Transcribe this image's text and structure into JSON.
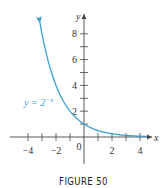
{
  "chart_data": {
    "type": "line",
    "title": "",
    "xlabel": "x",
    "ylabel": "y",
    "xlim": [
      -4.3,
      4.7
    ],
    "ylim": [
      -2,
      9.5
    ],
    "grid": false,
    "legend": null,
    "x_ticks": [
      -4,
      -3,
      -2,
      -1,
      0,
      1,
      2,
      3,
      4
    ],
    "x_tick_labels": [
      "-4",
      "-2",
      "0",
      "2",
      "4"
    ],
    "y_ticks": [
      1,
      2,
      3,
      4,
      5,
      6,
      7,
      8
    ],
    "y_tick_labels": [
      "2",
      "4",
      "6",
      "8"
    ],
    "series": [
      {
        "name": "y = 2^-x",
        "function": "2^(-x)",
        "x": [
          -3.15,
          -3,
          -2.5,
          -2,
          -1.5,
          -1,
          -0.5,
          0,
          0.5,
          1,
          1.5,
          2,
          2.5,
          3,
          3.5,
          4,
          4.5
        ],
        "values": [
          8.88,
          8,
          5.66,
          4,
          2.83,
          2,
          1.41,
          1,
          0.71,
          0.5,
          0.35,
          0.25,
          0.18,
          0.125,
          0.09,
          0.0625,
          0.044
        ],
        "color": "#3a9fd0"
      }
    ],
    "annotations": [
      {
        "text": "y = 2",
        "superscript": "−x",
        "position": "left of curve near y≈2.7"
      }
    ]
  },
  "labels": {
    "y_axis": "y",
    "x_axis": "x",
    "origin": "0",
    "curve_label_base": "y = 2",
    "curve_label_exp": "−x",
    "x_tick_text": [
      "−4",
      "−2",
      "2",
      "4"
    ],
    "y_tick_text": [
      "2",
      "4",
      "6",
      "8"
    ]
  },
  "caption": "FIGURE 50",
  "colors": {
    "curve": "#3a9fd0",
    "axis": "#444444",
    "text": "#333333"
  }
}
